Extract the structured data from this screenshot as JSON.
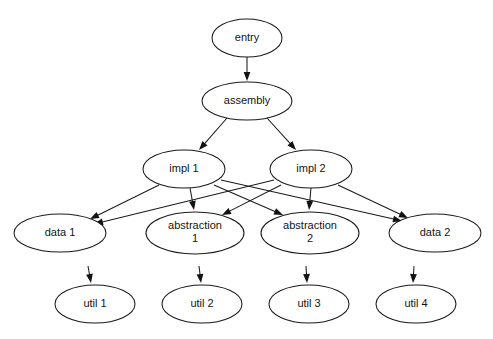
{
  "diagram": {
    "type": "directed-graph",
    "background_color": "#ffffff",
    "stroke_color": "#1a1a1a",
    "text_color": "#141414",
    "node_fill": "#ffffff",
    "canvas": {
      "width": 493,
      "height": 339
    },
    "nodes": [
      {
        "id": "entry",
        "label": "entry",
        "lines": [
          "entry"
        ],
        "cx": 247,
        "cy": 38,
        "rx": 35,
        "ry": 19,
        "level": 0
      },
      {
        "id": "assembly",
        "label": "assembly",
        "lines": [
          "assembly"
        ],
        "cx": 247,
        "cy": 101,
        "rx": 45,
        "ry": 19,
        "level": 1
      },
      {
        "id": "impl1",
        "label": "impl 1",
        "lines": [
          "impl 1"
        ],
        "cx": 184,
        "cy": 169,
        "rx": 41,
        "ry": 19,
        "level": 2
      },
      {
        "id": "impl2",
        "label": "impl 2",
        "lines": [
          "impl 2"
        ],
        "cx": 311,
        "cy": 169,
        "rx": 41,
        "ry": 19,
        "level": 2
      },
      {
        "id": "data1",
        "label": "data 1",
        "lines": [
          "data 1"
        ],
        "cx": 60,
        "cy": 233,
        "rx": 46,
        "ry": 19,
        "level": 3
      },
      {
        "id": "abstraction1",
        "label": "abstraction 1",
        "lines": [
          "abstraction",
          "1"
        ],
        "cx": 195,
        "cy": 233,
        "rx": 49,
        "ry": 21,
        "level": 3
      },
      {
        "id": "abstraction2",
        "label": "abstraction 2",
        "lines": [
          "abstraction",
          "2"
        ],
        "cx": 310,
        "cy": 233,
        "rx": 49,
        "ry": 21,
        "level": 3
      },
      {
        "id": "data2",
        "label": "data 2",
        "lines": [
          "data 2"
        ],
        "cx": 435,
        "cy": 233,
        "rx": 46,
        "ry": 19,
        "level": 3
      },
      {
        "id": "util1",
        "label": "util 1",
        "lines": [
          "util 1"
        ],
        "cx": 95,
        "cy": 304,
        "rx": 40,
        "ry": 19,
        "level": 4
      },
      {
        "id": "util2",
        "label": "util 2",
        "lines": [
          "util 2"
        ],
        "cx": 202,
        "cy": 304,
        "rx": 40,
        "ry": 19,
        "level": 4
      },
      {
        "id": "util3",
        "label": "util 3",
        "lines": [
          "util 3"
        ],
        "cx": 309,
        "cy": 304,
        "rx": 40,
        "ry": 19,
        "level": 4
      },
      {
        "id": "util4",
        "label": "util 4",
        "lines": [
          "util 4"
        ],
        "cx": 416,
        "cy": 304,
        "rx": 40,
        "ry": 19,
        "level": 4
      }
    ],
    "edges": [
      {
        "id": "e1",
        "from": "entry",
        "to": "assembly",
        "x1": 247,
        "y1": 57,
        "x2": 247,
        "y2": 81
      },
      {
        "id": "e2",
        "from": "assembly",
        "to": "impl1",
        "x1": 227,
        "y1": 118,
        "x2": 199,
        "y2": 150
      },
      {
        "id": "e3",
        "from": "assembly",
        "to": "impl2",
        "x1": 267,
        "y1": 118,
        "x2": 296,
        "y2": 150
      },
      {
        "id": "e4",
        "from": "impl1",
        "to": "data1",
        "x1": 159,
        "y1": 185,
        "x2": 90,
        "y2": 219
      },
      {
        "id": "e5",
        "from": "impl1",
        "to": "abstraction1",
        "x1": 190,
        "y1": 188,
        "x2": 194,
        "y2": 210
      },
      {
        "id": "e6",
        "from": "impl1",
        "to": "abstraction2",
        "x1": 214,
        "y1": 185,
        "x2": 283,
        "y2": 215
      },
      {
        "id": "e7",
        "from": "impl1",
        "to": "data2",
        "x1": 221,
        "y1": 180,
        "x2": 402,
        "y2": 221
      },
      {
        "id": "e8",
        "from": "impl2",
        "to": "data1",
        "x1": 274,
        "y1": 180,
        "x2": 94,
        "y2": 224
      },
      {
        "id": "e9",
        "from": "impl2",
        "to": "abstraction1",
        "x1": 281,
        "y1": 185,
        "x2": 222,
        "y2": 215
      },
      {
        "id": "e10",
        "from": "impl2",
        "to": "abstraction2",
        "x1": 311,
        "y1": 188,
        "x2": 309,
        "y2": 210
      },
      {
        "id": "e11",
        "from": "impl2",
        "to": "data2",
        "x1": 338,
        "y1": 185,
        "x2": 408,
        "y2": 218
      },
      {
        "id": "e12",
        "from": "data1",
        "to": "util1",
        "x1": 88,
        "y1": 266,
        "x2": 91,
        "y2": 283
      },
      {
        "id": "e13",
        "from": "abstraction1",
        "to": "util2",
        "x1": 199,
        "y1": 266,
        "x2": 201,
        "y2": 283
      },
      {
        "id": "e14",
        "from": "abstraction2",
        "to": "util3",
        "x1": 306,
        "y1": 266,
        "x2": 307,
        "y2": 283
      },
      {
        "id": "e15",
        "from": "data2",
        "to": "util4",
        "x1": 414,
        "y1": 266,
        "x2": 413,
        "y2": 283
      }
    ]
  }
}
